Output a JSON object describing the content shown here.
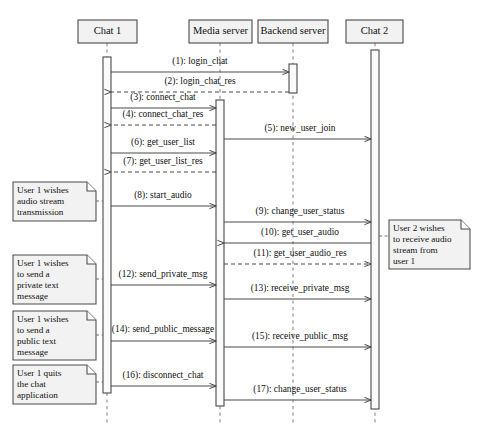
{
  "diagram": {
    "kind": "uml-sequence-diagram",
    "canvas": {
      "width": 479,
      "height": 438
    },
    "background_color": "#ffffff",
    "line_color": "#4a4a4a",
    "box_fill_color": "#f2f2f2",
    "lifelines": [
      {
        "id": "chat1",
        "label": "Chat 1",
        "box_x": 78,
        "box_y": 20,
        "box_w": 59,
        "box_h": 23,
        "x": 107
      },
      {
        "id": "media",
        "label": "Media server",
        "box_x": 189,
        "box_y": 20,
        "box_w": 63,
        "box_h": 23,
        "x": 220
      },
      {
        "id": "backend",
        "label": "Backend server",
        "box_x": 258,
        "box_y": 20,
        "box_w": 70,
        "box_h": 23,
        "x": 293
      },
      {
        "id": "chat2",
        "label": "Chat 2",
        "box_x": 346,
        "box_y": 20,
        "box_w": 57,
        "box_h": 23,
        "x": 375
      }
    ],
    "lifeline_bottom": 423,
    "activations": [
      {
        "id": "act-chat1",
        "lifeline": "chat1",
        "x": 103,
        "y": 57,
        "w": 8,
        "h": 336
      },
      {
        "id": "act-media",
        "lifeline": "media",
        "x": 216,
        "y": 100,
        "w": 8,
        "h": 306
      },
      {
        "id": "act-backend",
        "lifeline": "backend",
        "x": 289,
        "y": 64,
        "w": 8,
        "h": 29
      },
      {
        "id": "act-chat2",
        "lifeline": "chat2",
        "x": 371,
        "y": 50,
        "w": 8,
        "h": 359
      }
    ],
    "messages": [
      {
        "num": "1",
        "label": "(1): login_chat",
        "from": "chat1",
        "to": "backend",
        "y": 72,
        "style": "solid",
        "direction": "right",
        "label_x": 200,
        "label_y": 64
      },
      {
        "num": "2",
        "label": "(2): login_chat_res",
        "from": "backend",
        "to": "chat1",
        "y": 92,
        "style": "dashed",
        "direction": "left",
        "label_x": 200,
        "label_y": 84
      },
      {
        "num": "3",
        "label": "(3): connect_chat",
        "from": "chat1",
        "to": "media",
        "y": 108,
        "style": "solid",
        "direction": "right",
        "label_x": 163,
        "label_y": 100
      },
      {
        "num": "4",
        "label": "(4): connect_chat_res",
        "from": "media",
        "to": "chat1",
        "y": 125,
        "style": "dashed",
        "direction": "left",
        "label_x": 163,
        "label_y": 117
      },
      {
        "num": "5",
        "label": "(5): new_user_join",
        "from": "media",
        "to": "chat2",
        "y": 139,
        "style": "solid",
        "direction": "right",
        "label_x": 300,
        "label_y": 131
      },
      {
        "num": "6",
        "label": "(6): get_user_list",
        "from": "chat1",
        "to": "media",
        "y": 153,
        "style": "solid",
        "direction": "right",
        "label_x": 163,
        "label_y": 145
      },
      {
        "num": "7",
        "label": "(7): get_user_list_res",
        "from": "media",
        "to": "chat1",
        "y": 172,
        "style": "dashed",
        "direction": "left",
        "label_x": 163,
        "label_y": 164
      },
      {
        "num": "8",
        "label": "(8): start_audio",
        "from": "chat1",
        "to": "media",
        "y": 206,
        "style": "solid",
        "direction": "right",
        "label_x": 163,
        "label_y": 198
      },
      {
        "num": "9",
        "label": "(9): change_user_status",
        "from": "media",
        "to": "chat2",
        "y": 222,
        "style": "solid",
        "direction": "right",
        "label_x": 300,
        "label_y": 214
      },
      {
        "num": "10",
        "label": "(10): get_user_audio",
        "from": "chat2",
        "to": "media",
        "y": 243,
        "style": "solid",
        "direction": "left",
        "label_x": 300,
        "label_y": 235
      },
      {
        "num": "11",
        "label": "(11): get_user_audio_res",
        "from": "media",
        "to": "chat2",
        "y": 264,
        "style": "dashed",
        "direction": "right",
        "label_x": 300,
        "label_y": 256
      },
      {
        "num": "12",
        "label": "(12): send_private_msg",
        "from": "chat1",
        "to": "media",
        "y": 285,
        "style": "solid",
        "direction": "right",
        "label_x": 163,
        "label_y": 277
      },
      {
        "num": "13",
        "label": "(13): receive_private_msg",
        "from": "media",
        "to": "chat2",
        "y": 299,
        "style": "solid",
        "direction": "right",
        "label_x": 300,
        "label_y": 291
      },
      {
        "num": "14",
        "label": "(14): send_public_message",
        "from": "chat1",
        "to": "media",
        "y": 341,
        "style": "solid",
        "direction": "right",
        "label_x": 163,
        "label_y": 332
      },
      {
        "num": "15",
        "label": "(15): receive_public_msg",
        "from": "media",
        "to": "chat2",
        "y": 347,
        "style": "solid",
        "direction": "right",
        "label_x": 300,
        "label_y": 339
      },
      {
        "num": "16",
        "label": "(16): disconnect_chat",
        "from": "chat1",
        "to": "media",
        "y": 386,
        "style": "solid",
        "direction": "right",
        "label_x": 163,
        "label_y": 378
      },
      {
        "num": "17",
        "label": "(17): change_user_status",
        "from": "media",
        "to": "chat2",
        "y": 400,
        "style": "solid",
        "direction": "right",
        "label_x": 300,
        "label_y": 392
      }
    ],
    "notes": [
      {
        "id": "note-audio",
        "lines": [
          "User 1 wishes",
          "audio stream",
          "transmission"
        ],
        "x": 13,
        "y": 182,
        "w": 83,
        "h": 39,
        "anchor_side": "right",
        "anchor_x": 103,
        "anchor_y": 201
      },
      {
        "id": "note-private",
        "lines": [
          "User 1 wishes",
          "to send a",
          "private text",
          "message"
        ],
        "x": 13,
        "y": 255,
        "w": 83,
        "h": 49,
        "anchor_side": "right",
        "anchor_x": 103,
        "anchor_y": 279
      },
      {
        "id": "note-public",
        "lines": [
          "User 1 wishes",
          "to send a",
          "public text",
          "message"
        ],
        "x": 13,
        "y": 311,
        "w": 83,
        "h": 49,
        "anchor_side": "right",
        "anchor_x": 103,
        "anchor_y": 335
      },
      {
        "id": "note-quit",
        "lines": [
          "User 1 quits",
          "the chat",
          "application"
        ],
        "x": 13,
        "y": 365,
        "w": 83,
        "h": 39,
        "anchor_side": "right",
        "anchor_x": 103,
        "anchor_y": 382
      },
      {
        "id": "note-user2",
        "lines": [
          "User 2 wishes",
          "to receive audio",
          "stream from",
          "user 1"
        ],
        "x": 389,
        "y": 220,
        "w": 81,
        "h": 49,
        "anchor_side": "left",
        "anchor_x": 379,
        "anchor_y": 236
      }
    ]
  }
}
